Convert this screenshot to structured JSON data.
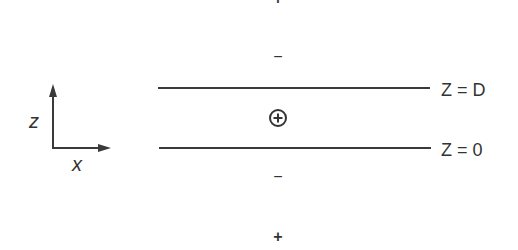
{
  "diagram": {
    "axes": {
      "vertical_label": "z",
      "horizontal_label": "x"
    },
    "planes": [
      {
        "label": "Z = D",
        "position": "upper"
      },
      {
        "label": "Z = 0",
        "position": "lower"
      }
    ],
    "charges": {
      "top_outer": "+",
      "top_inner": "−",
      "center": "⊕",
      "bottom_inner": "−",
      "bottom_outer": "+"
    },
    "colors": {
      "line": "#3a3a3a",
      "text": "#333333",
      "background": "#ffffff"
    }
  }
}
